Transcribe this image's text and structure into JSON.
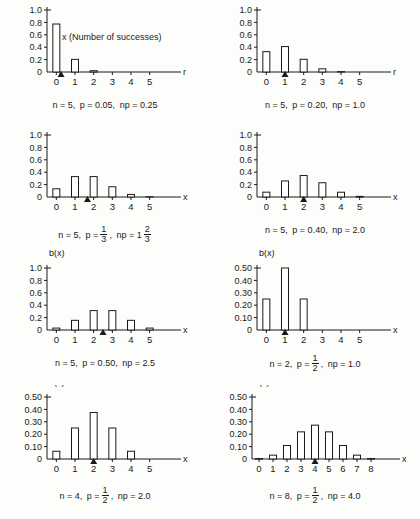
{
  "figure": {
    "axis_label_y": "b(x)",
    "annotation": "x (Number of successes)"
  },
  "chart_data": [
    {
      "id": "panel-1",
      "type": "bar",
      "title": "",
      "xlabel": "r",
      "ylabel": "b(x)",
      "categories": [
        "0",
        "1",
        "2",
        "3",
        "4",
        "5"
      ],
      "values": [
        0.774,
        0.204,
        0.021,
        0.001,
        0.0,
        0.0
      ],
      "ylim": [
        0,
        1.0
      ],
      "ytick_labels": [
        "1.0",
        "0.8",
        "0.6",
        "0.4",
        "0.2",
        "0"
      ],
      "yticks": [
        1.0,
        0.8,
        0.6,
        0.4,
        0.2,
        0
      ],
      "xlim": [
        0,
        5
      ],
      "mean_marker": 0.25,
      "grid": false,
      "legend": "none",
      "annotation": "x (Number of successes)",
      "caption": {
        "n": "n = 5,",
        "p": "p = 0.05,",
        "np": "np = 0.25"
      }
    },
    {
      "id": "panel-2",
      "type": "bar",
      "xlabel": "r",
      "ylabel": "b(x)",
      "categories": [
        "0",
        "1",
        "2",
        "3",
        "4",
        "5"
      ],
      "values": [
        0.328,
        0.41,
        0.205,
        0.051,
        0.006,
        0.0
      ],
      "ylim": [
        0,
        1.0
      ],
      "ytick_labels": [
        "1.0",
        "0.8",
        "0.6",
        "0.4",
        "0.2",
        "0"
      ],
      "yticks": [
        1.0,
        0.8,
        0.6,
        0.4,
        0.2,
        0
      ],
      "xlim": [
        0,
        5
      ],
      "mean_marker": 1.0,
      "grid": false,
      "caption": {
        "n": "n = 5,",
        "p": "p = 0.20,",
        "np": "np = 1.0"
      }
    },
    {
      "id": "panel-3",
      "type": "bar",
      "xlabel": "x",
      "ylabel": "b(x)",
      "categories": [
        "0",
        "1",
        "2",
        "3",
        "4",
        "5"
      ],
      "values": [
        0.132,
        0.329,
        0.329,
        0.165,
        0.041,
        0.004
      ],
      "ylim": [
        0,
        1.0
      ],
      "ytick_labels": [
        "1.0",
        "0.8",
        "0.6",
        "0.4",
        "0.2",
        "0"
      ],
      "yticks": [
        1.0,
        0.8,
        0.6,
        0.4,
        0.2,
        0
      ],
      "xlim": [
        0,
        5
      ],
      "mean_marker": 1.667,
      "grid": false,
      "caption": {
        "n": "n = 5,",
        "p_prefix": "p =",
        "p_frac_num": "1",
        "p_frac_den": "3",
        "p_suffix": ",",
        "np_prefix": "np = 1",
        "np_frac_num": "2",
        "np_frac_den": "3"
      }
    },
    {
      "id": "panel-4",
      "type": "bar",
      "xlabel": "x",
      "ylabel": "b(x)",
      "categories": [
        "0",
        "1",
        "2",
        "3",
        "4",
        "5"
      ],
      "values": [
        0.078,
        0.259,
        0.346,
        0.23,
        0.077,
        0.01
      ],
      "ylim": [
        0,
        1.0
      ],
      "ytick_labels": [
        "1.0",
        "0.8",
        "0.6",
        "0.4",
        "0.2",
        "0"
      ],
      "yticks": [
        1.0,
        0.8,
        0.6,
        0.4,
        0.2,
        0
      ],
      "xlim": [
        0,
        5
      ],
      "mean_marker": 2.0,
      "grid": false,
      "caption": {
        "n": "n = 5,",
        "p": "p = 0.40,",
        "np": "np = 2.0"
      }
    },
    {
      "id": "panel-5",
      "type": "bar",
      "xlabel": "x",
      "ylabel": "b(x)",
      "categories": [
        "0",
        "1",
        "2",
        "3",
        "4",
        "5"
      ],
      "values": [
        0.031,
        0.156,
        0.313,
        0.313,
        0.156,
        0.031
      ],
      "ylim": [
        0,
        1.0
      ],
      "ytick_labels": [
        "1.0",
        "0.8",
        "0.6",
        "0.4",
        "0.2",
        "0"
      ],
      "yticks": [
        1.0,
        0.8,
        0.6,
        0.4,
        0.2,
        0
      ],
      "xlim": [
        0,
        5
      ],
      "mean_marker": 2.5,
      "grid": false,
      "caption": {
        "n": "n = 5,",
        "p": "p = 0.50,",
        "np": "np = 2.5"
      }
    },
    {
      "id": "panel-6",
      "type": "bar",
      "xlabel": "x",
      "ylabel": "b(x)",
      "categories": [
        "0",
        "1",
        "2",
        "3",
        "4",
        "5"
      ],
      "values": [
        0.25,
        0.5,
        0.25,
        0.0,
        0.0,
        0.0
      ],
      "ylim": [
        0,
        0.5
      ],
      "ytick_labels": [
        "0.50",
        "0.40",
        "0.30",
        "0.20",
        "0.10",
        "0"
      ],
      "yticks": [
        0.5,
        0.4,
        0.3,
        0.2,
        0.1,
        0
      ],
      "xlim": [
        0,
        5
      ],
      "mean_marker": 1.0,
      "grid": false,
      "caption": {
        "n": "n = 2,",
        "p_prefix": "p =",
        "p_frac_num": "1",
        "p_frac_den": "2",
        "p_suffix": ",",
        "np": "np = 1.0"
      }
    },
    {
      "id": "panel-7",
      "type": "bar",
      "xlabel": "x",
      "ylabel": "b(x)",
      "categories": [
        "0",
        "1",
        "2",
        "3",
        "4",
        "5"
      ],
      "values": [
        0.0625,
        0.25,
        0.375,
        0.25,
        0.0625,
        0.0
      ],
      "ylim": [
        0,
        0.5
      ],
      "ytick_labels": [
        "0.50",
        "0.40",
        "0.30",
        "0.20",
        "0.10",
        "0"
      ],
      "yticks": [
        0.5,
        0.4,
        0.3,
        0.2,
        0.1,
        0
      ],
      "xlim": [
        0,
        5
      ],
      "mean_marker": 2.0,
      "grid": false,
      "caption": {
        "n": "n = 4,",
        "p_prefix": "p =",
        "p_frac_num": "1",
        "p_frac_den": "2",
        "p_suffix": ",",
        "np": "np = 2.0"
      }
    },
    {
      "id": "panel-8",
      "type": "bar",
      "xlabel": "x",
      "ylabel": "b(x)",
      "categories": [
        "0",
        "1",
        "2",
        "3",
        "4",
        "5",
        "6",
        "7",
        "8"
      ],
      "values": [
        0.004,
        0.031,
        0.109,
        0.219,
        0.273,
        0.219,
        0.109,
        0.031,
        0.004
      ],
      "ylim": [
        0,
        0.5
      ],
      "ytick_labels": [
        "0.50",
        "0.40",
        "0.30",
        "0.20",
        "0.10",
        "0"
      ],
      "yticks": [
        0.5,
        0.4,
        0.3,
        0.2,
        0.1,
        0
      ],
      "xlim": [
        0,
        8
      ],
      "mean_marker": 4.0,
      "grid": false,
      "caption": {
        "n": "n = 8,",
        "p_prefix": "p =",
        "p_frac_num": "1",
        "p_frac_den": "2",
        "p_suffix": ",",
        "np": "np = 4.0"
      }
    }
  ]
}
